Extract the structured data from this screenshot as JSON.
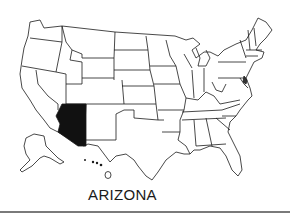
{
  "map": {
    "subject": "United States",
    "highlighted_state": "Arizona",
    "highlight_color": "#111111",
    "outline_color": "#1a1a1a",
    "background_color": "#ffffff",
    "insets": [
      "Alaska",
      "Hawaii"
    ]
  },
  "caption": {
    "label": "ARIZONA"
  },
  "rule": {
    "color": "#7a7a7a"
  }
}
